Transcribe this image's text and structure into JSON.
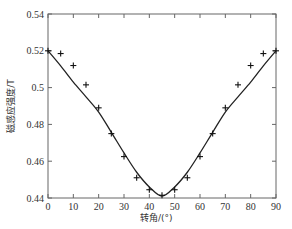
{
  "chart_data": {
    "type": "line",
    "title": "",
    "xlabel": "转角/(°)",
    "ylabel": "磁感应强度/T",
    "xlim": [
      0,
      90
    ],
    "ylim": [
      0.44,
      0.54
    ],
    "xticks": [
      0,
      10,
      20,
      30,
      40,
      50,
      60,
      70,
      80,
      90
    ],
    "yticks": [
      0.44,
      0.46,
      0.48,
      0.5,
      0.52,
      0.54
    ],
    "ytick_labels": [
      "0.44",
      "0.46",
      "0.48",
      "0.5",
      "0.52",
      "0.54"
    ],
    "grid": false,
    "legend": null,
    "series": [
      {
        "name": "measured",
        "style": "plus-markers",
        "x": [
          0,
          5,
          10,
          15,
          20,
          25,
          30,
          35,
          40,
          45,
          50,
          55,
          60,
          65,
          70,
          75,
          80,
          85,
          90
        ],
        "y": [
          0.52,
          0.5185,
          0.512,
          0.5015,
          0.489,
          0.475,
          0.4625,
          0.451,
          0.4445,
          0.4415,
          0.4445,
          0.451,
          0.4625,
          0.475,
          0.489,
          0.5015,
          0.512,
          0.5185,
          0.52
        ]
      },
      {
        "name": "simulated",
        "style": "solid-line",
        "x": [
          0,
          5,
          10,
          15,
          20,
          25,
          30,
          35,
          40,
          45,
          50,
          55,
          60,
          65,
          70,
          75,
          80,
          85,
          90
        ],
        "y": [
          0.52,
          0.5118,
          0.503,
          0.495,
          0.4867,
          0.4757,
          0.4645,
          0.454,
          0.446,
          0.441,
          0.446,
          0.454,
          0.4645,
          0.4757,
          0.4867,
          0.495,
          0.503,
          0.5118,
          0.52
        ]
      }
    ]
  },
  "colors": {
    "axis": "#555555",
    "line": "#222222",
    "marker": "#111111"
  }
}
